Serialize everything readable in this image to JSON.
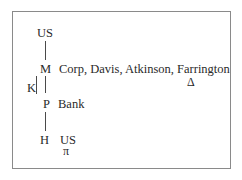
{
  "diagram": {
    "nodes": {
      "top_us": "US",
      "m": "M",
      "m_label": "Corp, Davis, Atkinson, Farrington",
      "m_symbol": "Δ",
      "k": "K",
      "p": "P",
      "p_label": "Bank",
      "h": "H",
      "h_label": "US",
      "h_symbol": "π"
    },
    "edges": [
      {
        "from": "US",
        "to": "M"
      },
      {
        "from": "M",
        "to": "P"
      },
      {
        "from": "P",
        "to": "H"
      }
    ],
    "bracket": {
      "label": "K",
      "spans": [
        "M",
        "P"
      ]
    }
  }
}
